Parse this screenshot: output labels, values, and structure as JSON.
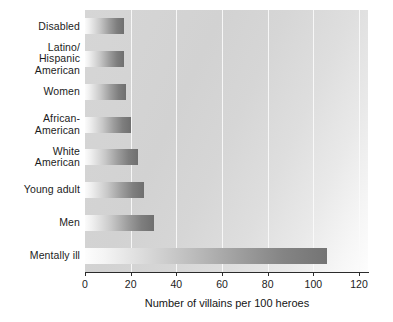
{
  "chart_data": {
    "type": "bar",
    "orientation": "horizontal",
    "title": "",
    "subtitle": "",
    "xlabel": "Number of villains per 100 heroes",
    "ylabel": "",
    "categories": [
      "Disabled",
      "Latino/\nHispanic\nAmerican",
      "Women",
      "African-\nAmerican",
      "White\nAmerican",
      "Young adult",
      "Men",
      "Mentally ill"
    ],
    "values": [
      17,
      17,
      18,
      20,
      23,
      26,
      30,
      106
    ],
    "xlim": [
      0,
      120
    ],
    "xticks": [
      0,
      20,
      40,
      60,
      80,
      100,
      120
    ],
    "xtick_labels": [
      "0",
      "20",
      "40",
      "60",
      "80",
      "100",
      "120"
    ],
    "grid": "vertical",
    "legend": "none",
    "bar_style": "grayscale-gradient",
    "colors": {
      "bar_start": "#fbfbfb",
      "bar_end": "#6f6f6f",
      "plot_background": "#d6d6d6",
      "gridline": "#fafafa",
      "axis": "#2b2b2b",
      "text": "#1c1c1c"
    }
  }
}
